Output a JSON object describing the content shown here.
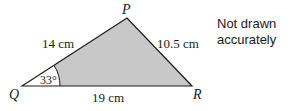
{
  "diagram": {
    "type": "triangle",
    "vertices": {
      "P": {
        "label": "P"
      },
      "Q": {
        "label": "Q"
      },
      "R": {
        "label": "R"
      }
    },
    "sides": {
      "PQ": "14 cm",
      "PR": "10.5 cm",
      "QR": "19 cm"
    },
    "angle_Q": "33°",
    "shading_color": "#c8c8c8",
    "note_line1": "Not drawn",
    "note_line2": "accurately"
  }
}
